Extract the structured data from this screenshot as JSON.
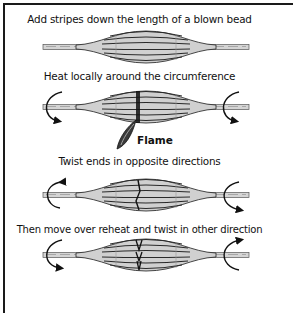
{
  "diagram": {
    "steps": [
      {
        "caption": "Add stripes down the length of a blown bead",
        "twist": "none",
        "mark": "none"
      },
      {
        "caption": "Heat locally around the circumference",
        "twist": "both-down",
        "mark": "heat-band"
      },
      {
        "caption": "Twist ends in opposite directions",
        "twist": "left-up-right-down",
        "mark": "twist-line"
      },
      {
        "caption": "Then move over reheat and twist in other direction",
        "twist": "left-down-right-up",
        "mark": "v-twist"
      }
    ],
    "flame_label": "Flame",
    "colors": {
      "ink": "#111111",
      "glass": "#c8c8c8",
      "stripe": "#2a2a2a",
      "flame": "#3a3a3a"
    }
  }
}
